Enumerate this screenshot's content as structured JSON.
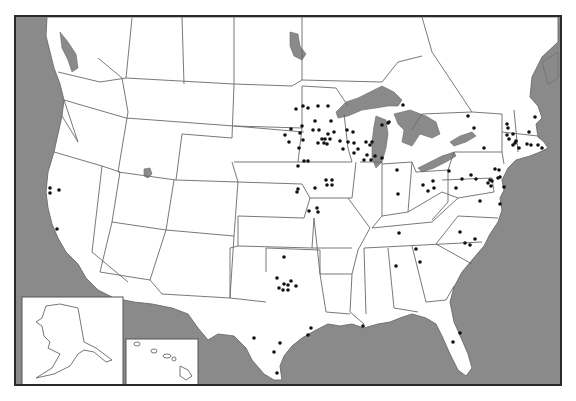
{
  "map": {
    "type": "US state outline map with location markers",
    "colors": {
      "water": "#8a8a8a",
      "land": "#ffffff",
      "border": "#6a6a6a",
      "frame": "#2a2a2a",
      "marker": "#111111"
    },
    "insets": [
      {
        "name": "Alaska",
        "x": 20,
        "y": 295,
        "w": 101,
        "h": 88
      },
      {
        "name": "Hawaii",
        "x": 124,
        "y": 337,
        "w": 72,
        "h": 46
      }
    ],
    "markers": [
      {
        "x": 48,
        "y": 186
      },
      {
        "x": 48,
        "y": 191
      },
      {
        "x": 57,
        "y": 188
      },
      {
        "x": 55,
        "y": 227
      },
      {
        "x": 294,
        "y": 107
      },
      {
        "x": 306,
        "y": 106
      },
      {
        "x": 326,
        "y": 104
      },
      {
        "x": 289,
        "y": 127
      },
      {
        "x": 300,
        "y": 124
      },
      {
        "x": 311,
        "y": 128
      },
      {
        "x": 313,
        "y": 119
      },
      {
        "x": 329,
        "y": 119
      },
      {
        "x": 283,
        "y": 133
      },
      {
        "x": 298,
        "y": 131
      },
      {
        "x": 323,
        "y": 137
      },
      {
        "x": 338,
        "y": 139
      },
      {
        "x": 287,
        "y": 140
      },
      {
        "x": 301,
        "y": 138
      },
      {
        "x": 297,
        "y": 146
      },
      {
        "x": 341,
        "y": 147
      },
      {
        "x": 301,
        "y": 104
      },
      {
        "x": 316,
        "y": 104
      },
      {
        "x": 320,
        "y": 137
      },
      {
        "x": 322,
        "y": 141
      },
      {
        "x": 316,
        "y": 141
      },
      {
        "x": 325,
        "y": 142
      },
      {
        "x": 328,
        "y": 137
      },
      {
        "x": 326,
        "y": 132
      },
      {
        "x": 332,
        "y": 130
      },
      {
        "x": 317,
        "y": 128
      },
      {
        "x": 345,
        "y": 128
      },
      {
        "x": 346,
        "y": 140
      },
      {
        "x": 352,
        "y": 141
      },
      {
        "x": 351,
        "y": 130
      },
      {
        "x": 356,
        "y": 147
      },
      {
        "x": 352,
        "y": 151
      },
      {
        "x": 364,
        "y": 140
      },
      {
        "x": 368,
        "y": 143
      },
      {
        "x": 370,
        "y": 140
      },
      {
        "x": 380,
        "y": 123
      },
      {
        "x": 386,
        "y": 121
      },
      {
        "x": 380,
        "y": 156
      },
      {
        "x": 362,
        "y": 158
      },
      {
        "x": 369,
        "y": 158
      },
      {
        "x": 365,
        "y": 153
      },
      {
        "x": 373,
        "y": 154
      },
      {
        "x": 401,
        "y": 103
      },
      {
        "x": 387,
        "y": 120
      },
      {
        "x": 296,
        "y": 164
      },
      {
        "x": 302,
        "y": 159
      },
      {
        "x": 306,
        "y": 159
      },
      {
        "x": 296,
        "y": 187
      },
      {
        "x": 324,
        "y": 178
      },
      {
        "x": 330,
        "y": 178
      },
      {
        "x": 325,
        "y": 183
      },
      {
        "x": 330,
        "y": 183
      },
      {
        "x": 313,
        "y": 186
      },
      {
        "x": 295,
        "y": 190
      },
      {
        "x": 307,
        "y": 209
      },
      {
        "x": 315,
        "y": 206
      },
      {
        "x": 316,
        "y": 210
      },
      {
        "x": 395,
        "y": 168
      },
      {
        "x": 396,
        "y": 192
      },
      {
        "x": 397,
        "y": 231
      },
      {
        "x": 418,
        "y": 260
      },
      {
        "x": 431,
        "y": 179
      },
      {
        "x": 432,
        "y": 186
      },
      {
        "x": 421,
        "y": 183
      },
      {
        "x": 426,
        "y": 189
      },
      {
        "x": 466,
        "y": 114
      },
      {
        "x": 472,
        "y": 126
      },
      {
        "x": 482,
        "y": 146
      },
      {
        "x": 447,
        "y": 169
      },
      {
        "x": 460,
        "y": 177
      },
      {
        "x": 469,
        "y": 173
      },
      {
        "x": 474,
        "y": 177
      },
      {
        "x": 454,
        "y": 186
      },
      {
        "x": 493,
        "y": 167
      },
      {
        "x": 497,
        "y": 168
      },
      {
        "x": 496,
        "y": 176
      },
      {
        "x": 488,
        "y": 178
      },
      {
        "x": 490,
        "y": 179
      },
      {
        "x": 486,
        "y": 181
      },
      {
        "x": 489,
        "y": 184
      },
      {
        "x": 498,
        "y": 175
      },
      {
        "x": 502,
        "y": 185
      },
      {
        "x": 478,
        "y": 199
      },
      {
        "x": 498,
        "y": 202
      },
      {
        "x": 505,
        "y": 122
      },
      {
        "x": 506,
        "y": 126
      },
      {
        "x": 505,
        "y": 133
      },
      {
        "x": 507,
        "y": 137
      },
      {
        "x": 511,
        "y": 132
      },
      {
        "x": 513,
        "y": 141
      },
      {
        "x": 511,
        "y": 143
      },
      {
        "x": 517,
        "y": 146
      },
      {
        "x": 514,
        "y": 139
      },
      {
        "x": 525,
        "y": 142
      },
      {
        "x": 529,
        "y": 143
      },
      {
        "x": 527,
        "y": 130
      },
      {
        "x": 533,
        "y": 115
      },
      {
        "x": 536,
        "y": 143
      },
      {
        "x": 540,
        "y": 146
      },
      {
        "x": 463,
        "y": 241
      },
      {
        "x": 468,
        "y": 243
      },
      {
        "x": 473,
        "y": 237
      },
      {
        "x": 458,
        "y": 230
      },
      {
        "x": 414,
        "y": 247
      },
      {
        "x": 394,
        "y": 264
      },
      {
        "x": 282,
        "y": 255
      },
      {
        "x": 275,
        "y": 276
      },
      {
        "x": 277,
        "y": 286
      },
      {
        "x": 281,
        "y": 288
      },
      {
        "x": 286,
        "y": 283
      },
      {
        "x": 286,
        "y": 288
      },
      {
        "x": 289,
        "y": 279
      },
      {
        "x": 294,
        "y": 284
      },
      {
        "x": 282,
        "y": 282
      },
      {
        "x": 252,
        "y": 336
      },
      {
        "x": 278,
        "y": 341
      },
      {
        "x": 272,
        "y": 350
      },
      {
        "x": 306,
        "y": 333
      },
      {
        "x": 309,
        "y": 326
      },
      {
        "x": 275,
        "y": 371
      },
      {
        "x": 361,
        "y": 324
      },
      {
        "x": 458,
        "y": 331
      },
      {
        "x": 451,
        "y": 340
      }
    ]
  }
}
